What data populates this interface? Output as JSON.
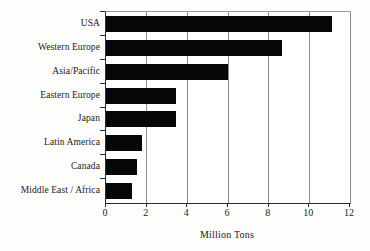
{
  "chart_data": {
    "type": "bar",
    "orientation": "horizontal",
    "title": "",
    "xlabel": "Million Tons",
    "ylabel": "",
    "categories": [
      "USA",
      "Western Europe",
      "Asia/Pacific",
      "Eastern Europe",
      "Japan",
      "Latin America",
      "Canada",
      "Middle East / Africa"
    ],
    "values": [
      11.1,
      8.65,
      6.0,
      3.45,
      3.45,
      1.75,
      1.5,
      1.3
    ],
    "xlim": [
      0,
      12
    ],
    "xticks": [
      0,
      2,
      4,
      6,
      8,
      10,
      12
    ],
    "xtick_labels": [
      "0",
      "2",
      "4",
      "6",
      "8",
      "10",
      "12"
    ],
    "grid": true,
    "grid_axis": "x",
    "legend": null,
    "legend_position": "none",
    "bar_color": "#070707",
    "grid_color": "#8c8c8c",
    "axis_color": "#2a2a2a",
    "background_color": "#ffffff"
  }
}
